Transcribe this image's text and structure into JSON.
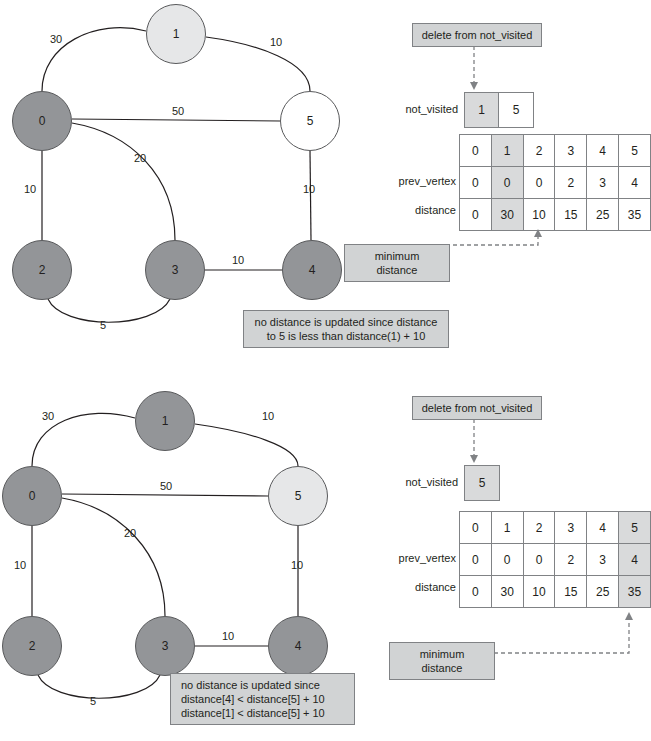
{
  "steps": [
    {
      "id": "step-1",
      "graph": {
        "nodes": [
          {
            "id": "0",
            "label": "0",
            "state": "visited",
            "cx": 42,
            "cy": 121
          },
          {
            "id": "1",
            "label": "1",
            "state": "current",
            "cx": 176,
            "cy": 34
          },
          {
            "id": "2",
            "label": "2",
            "state": "visited",
            "cx": 42,
            "cy": 270
          },
          {
            "id": "3",
            "label": "3",
            "state": "visited",
            "cx": 175,
            "cy": 270
          },
          {
            "id": "4",
            "label": "4",
            "state": "visited",
            "cx": 312,
            "cy": 270
          },
          {
            "id": "5",
            "label": "5",
            "state": "unvisited",
            "cx": 310,
            "cy": 121
          }
        ],
        "edges": [
          {
            "from": "0",
            "to": "1",
            "weight": "30"
          },
          {
            "from": "1",
            "to": "5",
            "weight": "10"
          },
          {
            "from": "0",
            "to": "5",
            "weight": "50"
          },
          {
            "from": "0",
            "to": "3",
            "weight": "20"
          },
          {
            "from": "0",
            "to": "2",
            "weight": "10"
          },
          {
            "from": "5",
            "to": "4",
            "weight": "10"
          },
          {
            "from": "3",
            "to": "4",
            "weight": "10"
          },
          {
            "from": "2",
            "to": "3",
            "weight": "5"
          }
        ]
      },
      "callout_graph": "no distance is updated since distance\nto 5 is less than distance(1) + 10",
      "delete_note": "delete from not_visited",
      "not_visited_label": "not_visited",
      "not_visited": [
        {
          "value": "1",
          "highlight": true
        },
        {
          "value": "5",
          "highlight": false
        }
      ],
      "table": {
        "index_label": "",
        "prev_label": "prev_vertex",
        "distance_label": "distance",
        "index": [
          "0",
          "1",
          "2",
          "3",
          "4",
          "5"
        ],
        "prev_vertex": [
          "0",
          "0",
          "0",
          "2",
          "3",
          "4"
        ],
        "distance": [
          "0",
          "30",
          "10",
          "15",
          "25",
          "35"
        ],
        "highlight_col": 1
      },
      "min_distance_note": "minimum distance"
    },
    {
      "id": "step-2",
      "graph": {
        "nodes": [
          {
            "id": "0",
            "label": "0",
            "state": "visited",
            "cx": 32,
            "cy": 126
          },
          {
            "id": "1",
            "label": "1",
            "state": "visited",
            "cx": 165,
            "cy": 51
          },
          {
            "id": "2",
            "label": "2",
            "state": "visited",
            "cx": 32,
            "cy": 276
          },
          {
            "id": "3",
            "label": "3",
            "state": "visited",
            "cx": 165,
            "cy": 276
          },
          {
            "id": "4",
            "label": "4",
            "state": "visited",
            "cx": 298,
            "cy": 276
          },
          {
            "id": "5",
            "label": "5",
            "state": "current",
            "cx": 298,
            "cy": 126
          }
        ],
        "edges": [
          {
            "from": "0",
            "to": "1",
            "weight": "30"
          },
          {
            "from": "1",
            "to": "5",
            "weight": "10"
          },
          {
            "from": "0",
            "to": "5",
            "weight": "50"
          },
          {
            "from": "0",
            "to": "3",
            "weight": "20"
          },
          {
            "from": "0",
            "to": "2",
            "weight": "10"
          },
          {
            "from": "5",
            "to": "4",
            "weight": "10"
          },
          {
            "from": "3",
            "to": "4",
            "weight": "10"
          },
          {
            "from": "2",
            "to": "3",
            "weight": "5"
          }
        ]
      },
      "callout_graph": "no distance is updated since\ndistance[4] < distance[5] + 10\ndistance[1] < distance[5] + 10",
      "delete_note": "delete from not_visited",
      "not_visited_label": "not_visited",
      "not_visited": [
        {
          "value": "5",
          "highlight": true
        }
      ],
      "table": {
        "index_label": "",
        "prev_label": "prev_vertex",
        "distance_label": "distance",
        "index": [
          "0",
          "1",
          "2",
          "3",
          "4",
          "5"
        ],
        "prev_vertex": [
          "0",
          "0",
          "0",
          "2",
          "3",
          "4"
        ],
        "distance": [
          "0",
          "30",
          "10",
          "15",
          "25",
          "35"
        ],
        "highlight_col": 5
      },
      "min_distance_note": "minimum distance"
    }
  ],
  "colors": {
    "node_visited": "#939598",
    "node_current": "#e6e7e8",
    "node_unvisited": "#ffffff",
    "note_bg": "#d1d3d4",
    "cell_highlight": "#d9dadb",
    "stroke": "#58595b"
  }
}
